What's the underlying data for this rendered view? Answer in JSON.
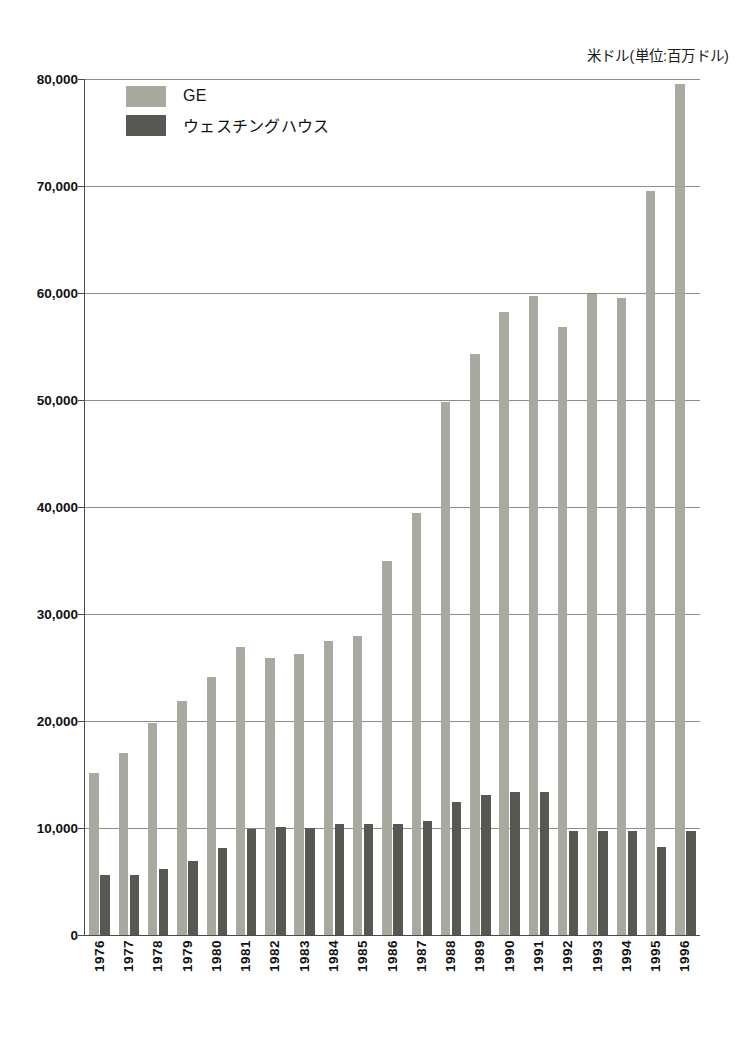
{
  "chart_data": {
    "type": "bar",
    "title": "",
    "unit_caption": "米ドル(単位:百万ドル)",
    "xlabel": "",
    "ylabel": "",
    "ylim": [
      0,
      80000
    ],
    "ytick_step": 10000,
    "grid": true,
    "legend_position": "top-left",
    "categories": [
      "1976",
      "1977",
      "1978",
      "1979",
      "1980",
      "1981",
      "1982",
      "1983",
      "1984",
      "1985",
      "1986",
      "1987",
      "1988",
      "1989",
      "1990",
      "1991",
      "1992",
      "1993",
      "1994",
      "1995",
      "1996"
    ],
    "ytick_labels": [
      "0",
      "10,000",
      "20,000",
      "30,000",
      "40,000",
      "50,000",
      "60,000",
      "70,000",
      "80,000"
    ],
    "ytick_values": [
      0,
      10000,
      20000,
      30000,
      40000,
      50000,
      60000,
      70000,
      80000
    ],
    "series": [
      {
        "name": "GE",
        "color": "#a9a9a0",
        "values": [
          15100,
          17000,
          19800,
          21900,
          24100,
          26900,
          25900,
          26300,
          27500,
          27900,
          35000,
          39400,
          49800,
          54300,
          58200,
          59700,
          56800,
          59900,
          59500,
          69500,
          79500
        ]
      },
      {
        "name": "ウェスチングハウス",
        "color": "#585853",
        "values": [
          5600,
          5600,
          6200,
          6900,
          8100,
          9900,
          10100,
          10000,
          10400,
          10400,
          10400,
          10700,
          12400,
          13100,
          13400,
          13400,
          9700,
          9700,
          9700,
          8200,
          9700
        ]
      }
    ]
  },
  "legend": {
    "items": [
      {
        "label": "GE",
        "color": "#a9a9a0"
      },
      {
        "label": "ウェスチングハウス",
        "color": "#585853"
      }
    ]
  },
  "colors": {
    "ge": "#a9a9a0",
    "westinghouse": "#585853",
    "axis": "#4a4a46",
    "gridline": "#8d8d86",
    "background": "#ffffff",
    "text": "#111111"
  }
}
